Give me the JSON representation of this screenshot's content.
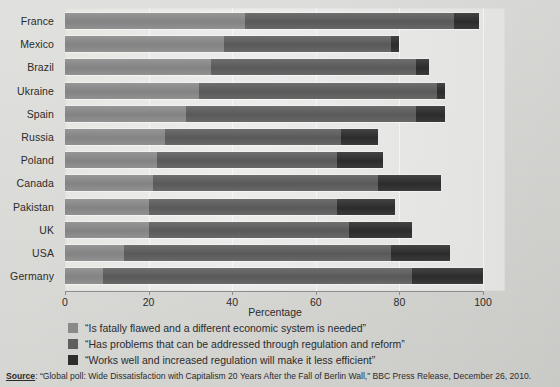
{
  "chart_data": {
    "type": "bar",
    "orientation": "horizontal",
    "stacked": true,
    "title": "",
    "xlabel": "Percentage",
    "ylabel": "",
    "xlim": [
      0,
      100
    ],
    "xticks": [
      0,
      20,
      40,
      60,
      80,
      100
    ],
    "grid": true,
    "legend_position": "bottom",
    "categories": [
      "France",
      "Mexico",
      "Brazil",
      "Ukraine",
      "Spain",
      "Russia",
      "Poland",
      "Canada",
      "Pakistan",
      "UK",
      "USA",
      "Germany"
    ],
    "series": [
      {
        "name": "“Is fatally flawed and a different economic system is needed”",
        "color": "#8a8a8a",
        "values": [
          43,
          38,
          35,
          32,
          29,
          24,
          22,
          21,
          20,
          20,
          14,
          9
        ]
      },
      {
        "name": "“Has problems that can be addressed through regulation and reform”",
        "color": "#5e5e5e",
        "values": [
          50,
          40,
          49,
          57,
          55,
          42,
          43,
          54,
          45,
          48,
          64,
          74
        ]
      },
      {
        "name": "“Works well and increased regulation will make it less efficient”",
        "color": "#2e2e2e",
        "values": [
          6,
          2,
          3,
          2,
          7,
          9,
          11,
          15,
          14,
          15,
          14,
          17
        ]
      }
    ]
  },
  "axis": {
    "x_title": "Percentage",
    "tick_labels": [
      "0",
      "20",
      "40",
      "60",
      "80",
      "100"
    ]
  },
  "legend": {
    "items": [
      {
        "label": "“Is fatally flawed and a different economic system is needed”"
      },
      {
        "label": "“Has problems that can be addressed through regulation and reform”"
      },
      {
        "label": "“Works well and increased regulation will make it less efficient”"
      }
    ]
  },
  "source": {
    "label": "Source",
    "text": ": “Global poll: Wide Dissatisfaction with Capitalism 20 Years After the Fall of Berlin Wall,” BBC Press Release, December 26, 2010."
  }
}
